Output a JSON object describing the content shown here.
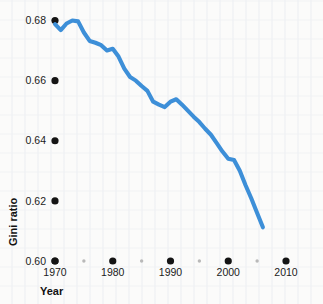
{
  "chart_data": {
    "type": "line",
    "title": "",
    "xlabel": "Year",
    "ylabel": "Gini ratio",
    "xlim": [
      1970,
      2010
    ],
    "ylim": [
      0.6,
      0.68
    ],
    "grid": false,
    "legend": false,
    "line_color": "#3d8fd8",
    "x_ticks": [
      1970,
      1980,
      1990,
      2000,
      2010
    ],
    "x_tick_labels": [
      "1970",
      "1980",
      "1990",
      "2000",
      "2010"
    ],
    "x_minor_ticks": [
      1975,
      1985,
      1995,
      2005
    ],
    "y_ticks": [
      0.6,
      0.62,
      0.64,
      0.66,
      0.68
    ],
    "y_tick_labels": [
      "0.60",
      "0.62",
      "0.64",
      "0.66",
      "0.68"
    ],
    "series": [
      {
        "name": "Gini ratio",
        "x": [
          1970,
          1971,
          1972,
          1973,
          1974,
          1975,
          1976,
          1977,
          1978,
          1979,
          1980,
          1981,
          1982,
          1983,
          1984,
          1985,
          1986,
          1987,
          1988,
          1989,
          1990,
          1991,
          1992,
          1993,
          1994,
          1995,
          1996,
          1997,
          1998,
          1999,
          2000,
          2001,
          2002,
          2003,
          2004,
          2005,
          2006
        ],
        "values": [
          0.6788,
          0.6768,
          0.679,
          0.68,
          0.6797,
          0.676,
          0.6732,
          0.6726,
          0.6718,
          0.67,
          0.6706,
          0.668,
          0.664,
          0.6612,
          0.66,
          0.6582,
          0.6566,
          0.653,
          0.652,
          0.6512,
          0.653,
          0.6538,
          0.652,
          0.65,
          0.648,
          0.6462,
          0.644,
          0.642,
          0.6392,
          0.6364,
          0.634,
          0.6336,
          0.63,
          0.6252,
          0.6208,
          0.616,
          0.6112
        ]
      }
    ]
  },
  "axis": {
    "y_title": "Gini ratio",
    "x_title": "Year"
  }
}
